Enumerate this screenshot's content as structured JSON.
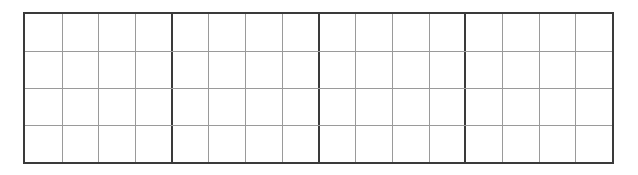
{
  "grid": {
    "major_columns": 4,
    "minor_columns_per_major": 4,
    "rows": 4,
    "colors": {
      "major_line": "#3a3a3a",
      "minor_line": "#9a9a9a",
      "background": "#ffffff"
    }
  }
}
